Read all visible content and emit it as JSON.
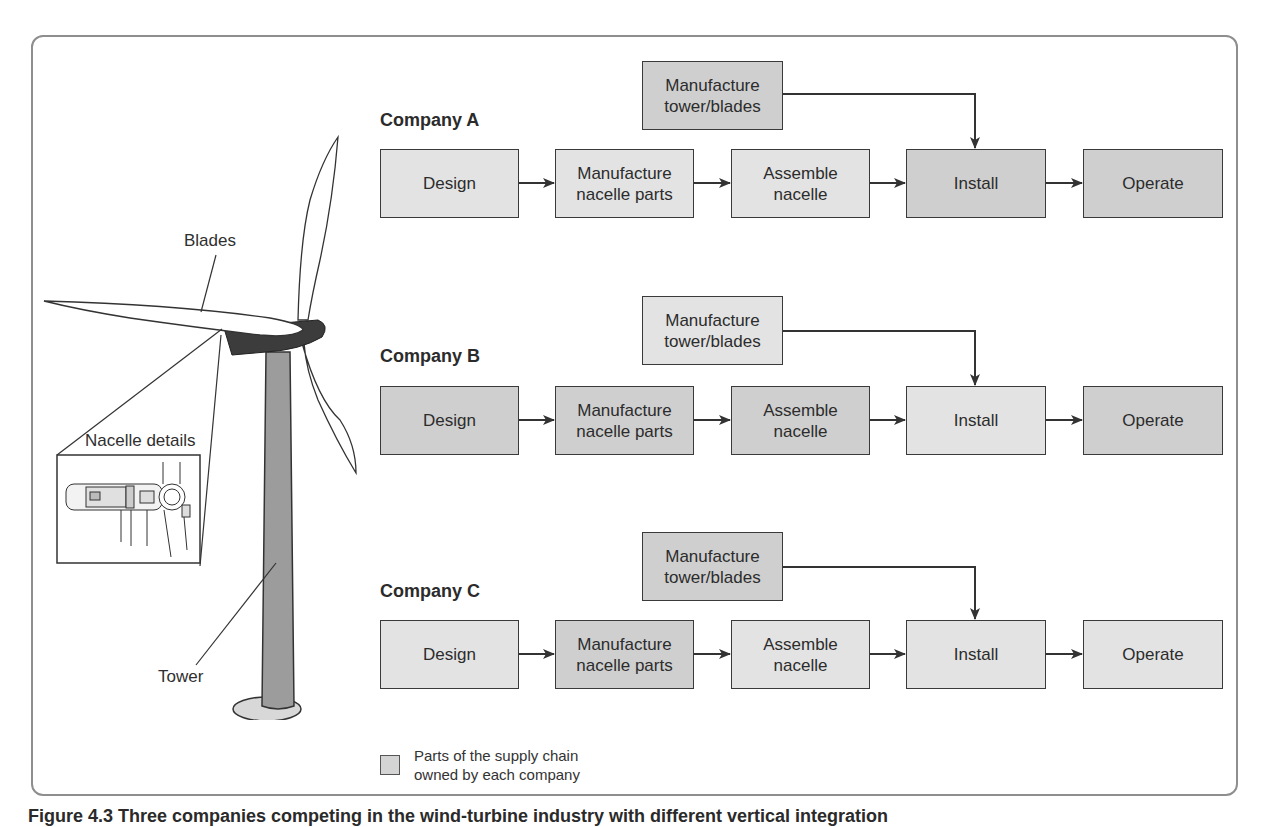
{
  "figure": {
    "caption": "Figure 4.3  Three companies competing in the wind-turbine industry with different vertical integration",
    "colors": {
      "owned_fill": "#cfcfcf",
      "not_owned_fill": "#e3e3e3",
      "border": "#3a3a3a",
      "frame": "#8e8e8e",
      "tower_fill": "#9a9a9a",
      "nacelle_fill": "#3c3c3c"
    }
  },
  "turbine": {
    "labels": {
      "blades": "Blades",
      "nacelle_details": "Nacelle details",
      "tower": "Tower"
    }
  },
  "companies": [
    {
      "name": "Company A",
      "tower_blades": {
        "label": "Manufacture\ntower/blades",
        "owned": true
      },
      "steps": [
        {
          "label": "Design",
          "owned": false
        },
        {
          "label": "Manufacture\nnacelle parts",
          "owned": false
        },
        {
          "label": "Assemble\nnacelle",
          "owned": false
        },
        {
          "label": "Install",
          "owned": true
        },
        {
          "label": "Operate",
          "owned": true
        }
      ]
    },
    {
      "name": "Company B",
      "tower_blades": {
        "label": "Manufacture\ntower/blades",
        "owned": false
      },
      "steps": [
        {
          "label": "Design",
          "owned": true
        },
        {
          "label": "Manufacture\nnacelle parts",
          "owned": true
        },
        {
          "label": "Assemble\nnacelle",
          "owned": true
        },
        {
          "label": "Install",
          "owned": false
        },
        {
          "label": "Operate",
          "owned": true
        }
      ]
    },
    {
      "name": "Company C",
      "tower_blades": {
        "label": "Manufacture\ntower/blades",
        "owned": true
      },
      "steps": [
        {
          "label": "Design",
          "owned": false
        },
        {
          "label": "Manufacture\nnacelle parts",
          "owned": true
        },
        {
          "label": "Assemble\nnacelle",
          "owned": false
        },
        {
          "label": "Install",
          "owned": false
        },
        {
          "label": "Operate",
          "owned": false
        }
      ]
    }
  ],
  "legend": {
    "text": "Parts of the supply chain\nowned by each company"
  }
}
